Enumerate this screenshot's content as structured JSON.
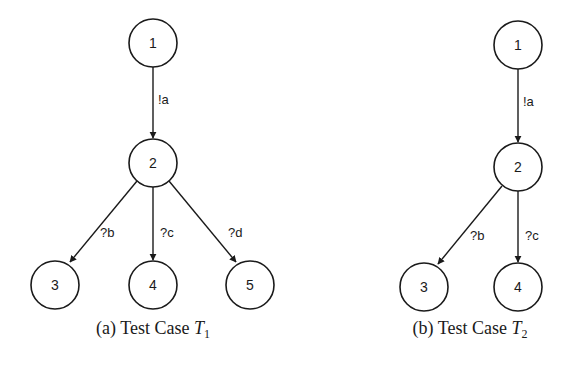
{
  "figures": [
    {
      "id": "a",
      "caption_prefix": "(a) Test Case ",
      "caption_var": "T",
      "caption_sub": "1",
      "nodes": [
        {
          "id": "1",
          "label": "1",
          "x": 153,
          "y": 43
        },
        {
          "id": "2",
          "label": "2",
          "x": 153,
          "y": 163
        },
        {
          "id": "3",
          "label": "3",
          "x": 55,
          "y": 285
        },
        {
          "id": "4",
          "label": "4",
          "x": 153,
          "y": 285
        },
        {
          "id": "5",
          "label": "5",
          "x": 250,
          "y": 285
        }
      ],
      "edges": [
        {
          "from": "1",
          "to": "2",
          "label": "!a"
        },
        {
          "from": "2",
          "to": "3",
          "label": "?b"
        },
        {
          "from": "2",
          "to": "4",
          "label": "?c"
        },
        {
          "from": "2",
          "to": "5",
          "label": "?d"
        }
      ]
    },
    {
      "id": "b",
      "caption_prefix": "(b) Test Case ",
      "caption_var": "T",
      "caption_sub": "2",
      "nodes": [
        {
          "id": "1",
          "label": "1",
          "x": 518,
          "y": 45
        },
        {
          "id": "2",
          "label": "2",
          "x": 518,
          "y": 167
        },
        {
          "id": "3",
          "label": "3",
          "x": 424,
          "y": 287
        },
        {
          "id": "4",
          "label": "4",
          "x": 518,
          "y": 287
        }
      ],
      "edges": [
        {
          "from": "1",
          "to": "2",
          "label": "!a"
        },
        {
          "from": "2",
          "to": "3",
          "label": "?b"
        },
        {
          "from": "2",
          "to": "4",
          "label": "?c"
        }
      ]
    }
  ]
}
